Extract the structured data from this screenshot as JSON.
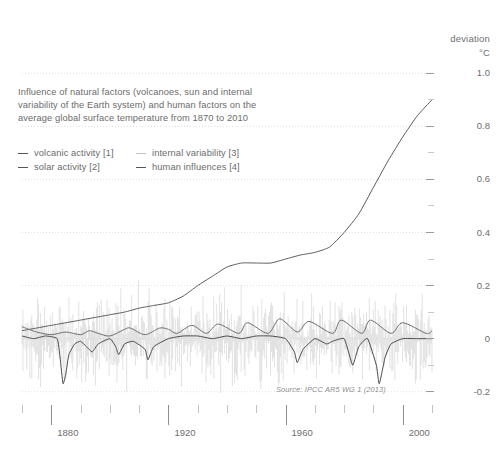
{
  "axis_header": {
    "deviation_label": "deviation",
    "unit_label": "°C"
  },
  "description": "Influence of natural factors (volcanoes, sun and internal variability of the Earth system) and human factors on the average global surface temperature from 1870 to 2010",
  "legend": {
    "items": [
      {
        "label": "volcanic activity [1]",
        "swatch": "dark"
      },
      {
        "label": "internal variability [3]",
        "swatch": "faint"
      },
      {
        "label": "solar activity [2]",
        "swatch": "dark"
      },
      {
        "label": "human influences [4]",
        "swatch": "dark"
      }
    ]
  },
  "source_note": "Source: IPCC AR5 WG 1 (2013)",
  "colors": {
    "background": "#ffffff",
    "text": "#6b6b6b",
    "axis": "#9a9a9a",
    "gridline": "#d8d8d8",
    "volcanic": "#4a4a4a",
    "solar": "#6f6f6f",
    "internal_variability": "#cfcfcf",
    "human": "#5c5c5c"
  },
  "chart_data": {
    "type": "line",
    "title": "Influence of natural factors (volcanoes, sun and internal variability of the Earth system) and human factors on the average global surface temperature from 1870 to 2010",
    "xlabel": "",
    "ylabel": "deviation °C",
    "xlim": [
      1870,
      2010
    ],
    "ylim": [
      -0.25,
      1.05
    ],
    "grid": true,
    "grid_axis": "y",
    "legend_position": "top-left",
    "x_major_ticks": [
      1880,
      1920,
      1960,
      2000
    ],
    "x_minor_ticks": [
      1870,
      1890,
      1900,
      1910,
      1930,
      1940,
      1950,
      1970,
      1980,
      1990,
      2010
    ],
    "y_major_ticks": [
      1.0,
      0.8,
      0.6,
      0.4,
      0.2,
      0,
      -0.2
    ],
    "y_major_tick_labels": [
      "1.0",
      "0.8",
      "0.6",
      "0.4",
      "0.2",
      "0",
      "-0.2"
    ],
    "y_minor_ticks": [
      0.9,
      0.7,
      0.5,
      0.3,
      0.1,
      -0.1
    ],
    "series": [
      {
        "name": "human influences [4]",
        "key": "human",
        "color": "#5c5c5c",
        "x": [
          1870,
          1875,
          1880,
          1885,
          1890,
          1895,
          1900,
          1905,
          1910,
          1915,
          1920,
          1925,
          1930,
          1935,
          1940,
          1945,
          1950,
          1955,
          1960,
          1965,
          1970,
          1975,
          1980,
          1985,
          1990,
          1995,
          2000,
          2005,
          2010
        ],
        "values": [
          0.03,
          0.04,
          0.05,
          0.06,
          0.07,
          0.08,
          0.09,
          0.1,
          0.115,
          0.125,
          0.135,
          0.16,
          0.2,
          0.235,
          0.27,
          0.285,
          0.285,
          0.285,
          0.3,
          0.315,
          0.325,
          0.345,
          0.4,
          0.47,
          0.57,
          0.67,
          0.76,
          0.84,
          0.9
        ]
      },
      {
        "name": "volcanic activity [1]",
        "key": "volcanic",
        "color": "#4a4a4a",
        "x": [
          1870,
          1874,
          1878,
          1882,
          1883,
          1884,
          1885,
          1886,
          1888,
          1890,
          1892,
          1894,
          1896,
          1900,
          1902,
          1903,
          1905,
          1908,
          1912,
          1913,
          1915,
          1920,
          1925,
          1930,
          1935,
          1940,
          1945,
          1950,
          1955,
          1960,
          1963,
          1964,
          1966,
          1970,
          1974,
          1976,
          1980,
          1982,
          1983,
          1985,
          1988,
          1991,
          1992,
          1994,
          1996,
          2000,
          2005,
          2010
        ],
        "values": [
          0.01,
          0.0,
          0.01,
          0.0,
          -0.07,
          -0.17,
          -0.13,
          -0.06,
          -0.02,
          -0.01,
          -0.03,
          -0.05,
          -0.02,
          0.0,
          -0.03,
          -0.06,
          -0.02,
          -0.01,
          -0.04,
          -0.08,
          -0.03,
          0.0,
          0.01,
          0.01,
          0.0,
          0.01,
          0.0,
          0.01,
          0.01,
          0.0,
          -0.05,
          -0.09,
          -0.04,
          0.0,
          -0.02,
          -0.01,
          0.0,
          -0.07,
          -0.1,
          -0.03,
          0.0,
          -0.1,
          -0.17,
          -0.07,
          -0.02,
          0.0,
          0.0,
          0.0
        ]
      },
      {
        "name": "solar activity [2]",
        "key": "solar",
        "color": "#6f6f6f",
        "x": [
          1870,
          1875,
          1880,
          1885,
          1890,
          1893,
          1896,
          1900,
          1905,
          1907,
          1912,
          1917,
          1920,
          1923,
          1928,
          1933,
          1937,
          1944,
          1947,
          1954,
          1958,
          1964,
          1968,
          1976,
          1979,
          1986,
          1989,
          1996,
          2000,
          2008,
          2010
        ],
        "values": [
          0.045,
          0.025,
          0.015,
          0.025,
          0.015,
          0.03,
          0.02,
          0.01,
          0.035,
          0.04,
          0.015,
          0.04,
          0.035,
          0.02,
          0.05,
          0.02,
          0.055,
          0.02,
          0.06,
          0.02,
          0.075,
          0.025,
          0.065,
          0.02,
          0.07,
          0.02,
          0.07,
          0.02,
          0.06,
          0.02,
          0.03
        ]
      },
      {
        "name": "internal variability [3]",
        "key": "internal",
        "color": "#cfcfcf",
        "note": "high-frequency interannual noise band, approx ±0.15 °C about 0"
      }
    ]
  }
}
